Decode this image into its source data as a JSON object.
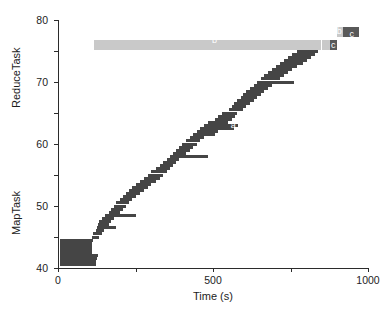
{
  "chart_data": {
    "type": "bar",
    "title": "",
    "xlabel": "Time (s)",
    "ylabel_lower": "MapTask",
    "ylabel_upper": "ReduceTask",
    "xlim": [
      0,
      2000
    ],
    "ylim": [
      0,
      80
    ],
    "xticks": [
      0,
      500,
      1000,
      1500,
      2000
    ],
    "yticks": [
      0,
      10,
      20,
      30,
      40,
      50,
      60,
      70,
      80
    ],
    "grid": false,
    "legend": "none",
    "annotations": [
      {
        "text": "a",
        "x": 1130,
        "y": 46,
        "meaning": "map-task-phase"
      },
      {
        "text": "b",
        "x": 1010,
        "y": 73.5,
        "meaning": "shuffle-phase"
      },
      {
        "text": "b",
        "x": 1815,
        "y": 76.5,
        "meaning": "shuffle-phase-tail"
      },
      {
        "text": "c",
        "x": 1775,
        "y": 72,
        "meaning": "reduce-phase"
      },
      {
        "text": "c",
        "x": 1895,
        "y": 75.5,
        "meaning": "reduce-phase"
      }
    ],
    "colors": {
      "map_task": "#454545",
      "shuffle": "#c9c9c9",
      "reduce_dark": "#595959",
      "axis": "#2b2b2b",
      "background": "#ffffff"
    },
    "series": [
      {
        "name": "MapTask",
        "color": "#454545",
        "kind": "gantt-staircase",
        "bars": [
          {
            "task": 1,
            "start": 10,
            "end": 245
          },
          {
            "task": 2,
            "start": 10,
            "end": 245
          },
          {
            "task": 3,
            "start": 10,
            "end": 250
          },
          {
            "task": 4,
            "start": 10,
            "end": 258
          },
          {
            "task": 5,
            "start": 10,
            "end": 222
          },
          {
            "task": 6,
            "start": 10,
            "end": 222
          },
          {
            "task": 7,
            "start": 10,
            "end": 222
          },
          {
            "task": 8,
            "start": 10,
            "end": 222
          },
          {
            "task": 9,
            "start": 10,
            "end": 228
          },
          {
            "task": 10,
            "start": 222,
            "end": 262
          },
          {
            "task": 11,
            "start": 228,
            "end": 282
          },
          {
            "task": 12,
            "start": 245,
            "end": 300
          },
          {
            "task": 13,
            "start": 250,
            "end": 372
          },
          {
            "task": 14,
            "start": 258,
            "end": 330
          },
          {
            "task": 15,
            "start": 262,
            "end": 345
          },
          {
            "task": 16,
            "start": 282,
            "end": 360
          },
          {
            "task": 17,
            "start": 300,
            "end": 500
          },
          {
            "task": 18,
            "start": 330,
            "end": 400
          },
          {
            "task": 19,
            "start": 345,
            "end": 420
          },
          {
            "task": 20,
            "start": 360,
            "end": 438
          },
          {
            "task": 21,
            "start": 372,
            "end": 455
          },
          {
            "task": 22,
            "start": 400,
            "end": 478
          },
          {
            "task": 23,
            "start": 420,
            "end": 505
          },
          {
            "task": 24,
            "start": 438,
            "end": 530
          },
          {
            "task": 25,
            "start": 455,
            "end": 555
          },
          {
            "task": 26,
            "start": 478,
            "end": 578
          },
          {
            "task": 27,
            "start": 505,
            "end": 600
          },
          {
            "task": 28,
            "start": 530,
            "end": 632
          },
          {
            "task": 29,
            "start": 555,
            "end": 660
          },
          {
            "task": 30,
            "start": 578,
            "end": 680
          },
          {
            "task": 31,
            "start": 600,
            "end": 700
          },
          {
            "task": 32,
            "start": 632,
            "end": 720
          },
          {
            "task": 33,
            "start": 660,
            "end": 742
          },
          {
            "task": 34,
            "start": 680,
            "end": 762
          },
          {
            "task": 35,
            "start": 700,
            "end": 782
          },
          {
            "task": 36,
            "start": 720,
            "end": 965
          },
          {
            "task": 37,
            "start": 742,
            "end": 828
          },
          {
            "task": 38,
            "start": 762,
            "end": 850
          },
          {
            "task": 39,
            "start": 782,
            "end": 872
          },
          {
            "task": 40,
            "start": 800,
            "end": 895
          },
          {
            "task": 41,
            "start": 828,
            "end": 918
          },
          {
            "task": 42,
            "start": 850,
            "end": 940
          },
          {
            "task": 43,
            "start": 872,
            "end": 1010
          },
          {
            "task": 44,
            "start": 895,
            "end": 1035
          },
          {
            "task": 45,
            "start": 918,
            "end": 1138
          },
          {
            "task": 46,
            "start": 940,
            "end": 1160
          },
          {
            "task": 47,
            "start": 965,
            "end": 1100
          },
          {
            "task": 48,
            "start": 1010,
            "end": 1120
          },
          {
            "task": 49,
            "start": 1035,
            "end": 1140
          },
          {
            "task": 50,
            "start": 1060,
            "end": 1158
          },
          {
            "task": 51,
            "start": 1100,
            "end": 1195
          },
          {
            "task": 52,
            "start": 1120,
            "end": 1215
          },
          {
            "task": 53,
            "start": 1138,
            "end": 1238
          },
          {
            "task": 54,
            "start": 1158,
            "end": 1262
          },
          {
            "task": 55,
            "start": 1178,
            "end": 1285
          },
          {
            "task": 56,
            "start": 1195,
            "end": 1308
          },
          {
            "task": 57,
            "start": 1215,
            "end": 1330
          },
          {
            "task": 58,
            "start": 1238,
            "end": 1352
          },
          {
            "task": 59,
            "start": 1262,
            "end": 1378
          },
          {
            "task": 60,
            "start": 1285,
            "end": 1520
          },
          {
            "task": 61,
            "start": 1308,
            "end": 1432
          },
          {
            "task": 62,
            "start": 1330,
            "end": 1458
          },
          {
            "task": 63,
            "start": 1352,
            "end": 1485
          },
          {
            "task": 64,
            "start": 1378,
            "end": 1512
          },
          {
            "task": 65,
            "start": 1405,
            "end": 1545
          },
          {
            "task": 66,
            "start": 1432,
            "end": 1578
          },
          {
            "task": 67,
            "start": 1458,
            "end": 1608
          },
          {
            "task": 68,
            "start": 1485,
            "end": 1635
          },
          {
            "task": 69,
            "start": 1512,
            "end": 1660
          },
          {
            "task": 70,
            "start": 1545,
            "end": 1678
          }
        ]
      },
      {
        "name": "ReduceTask",
        "kind": "gantt",
        "bars": [
          {
            "task": 72,
            "start": 230,
            "end": 1700,
            "phase": "b",
            "color": "#c9c9c9"
          },
          {
            "task": 72,
            "start": 1700,
            "end": 1760,
            "phase": "b",
            "color": "#c9c9c9"
          },
          {
            "task": 72,
            "start": 1752,
            "end": 1800,
            "phase": "c",
            "color": "#595959"
          },
          {
            "task": 76,
            "start": 1800,
            "end": 1838,
            "phase": "b",
            "color": "#c9c9c9"
          },
          {
            "task": 76,
            "start": 1838,
            "end": 1940,
            "phase": "c",
            "color": "#595959"
          }
        ]
      }
    ]
  },
  "axes": {
    "x": {
      "label": "Time (s)",
      "ticks": [
        "0",
        "500",
        "1000",
        "1500",
        "2000"
      ]
    },
    "y": {
      "label_lower": "MapTask",
      "label_upper": "ReduceTask",
      "ticks": [
        "0",
        "10",
        "20",
        "30",
        "40",
        "50",
        "60",
        "70",
        "80"
      ]
    }
  }
}
